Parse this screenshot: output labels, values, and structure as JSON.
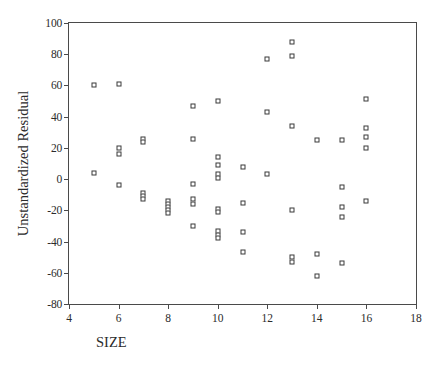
{
  "chart_data": {
    "type": "scatter",
    "title": "",
    "xlabel": "SIZE",
    "ylabel": "Unstandardized Residual",
    "xlim": [
      4,
      18
    ],
    "ylim": [
      -80,
      100
    ],
    "xticks": [
      4,
      6,
      8,
      10,
      12,
      14,
      16,
      18
    ],
    "yticks": [
      100,
      80,
      60,
      40,
      20,
      0,
      -20,
      -40,
      -60,
      -80
    ],
    "grid": false,
    "legend": null,
    "marker": "open-square",
    "marker_color": "#3a3a3a",
    "frame_color": "#4a4a4a",
    "points": [
      {
        "x": 5,
        "y": 60
      },
      {
        "x": 5,
        "y": 4
      },
      {
        "x": 6,
        "y": 61
      },
      {
        "x": 6,
        "y": 20
      },
      {
        "x": 6,
        "y": 16
      },
      {
        "x": 6,
        "y": -4
      },
      {
        "x": 7,
        "y": 26
      },
      {
        "x": 7,
        "y": 24
      },
      {
        "x": 7,
        "y": -9
      },
      {
        "x": 7,
        "y": -11
      },
      {
        "x": 7,
        "y": -13
      },
      {
        "x": 8,
        "y": -14
      },
      {
        "x": 8,
        "y": -16
      },
      {
        "x": 8,
        "y": -18
      },
      {
        "x": 8,
        "y": -20
      },
      {
        "x": 8,
        "y": -22
      },
      {
        "x": 9,
        "y": 47
      },
      {
        "x": 9,
        "y": 26
      },
      {
        "x": 9,
        "y": -3
      },
      {
        "x": 9,
        "y": -13
      },
      {
        "x": 9,
        "y": -16
      },
      {
        "x": 9,
        "y": -30
      },
      {
        "x": 10,
        "y": 50
      },
      {
        "x": 10,
        "y": 14
      },
      {
        "x": 10,
        "y": 9
      },
      {
        "x": 10,
        "y": 3
      },
      {
        "x": 10,
        "y": 1
      },
      {
        "x": 10,
        "y": -19
      },
      {
        "x": 10,
        "y": -21
      },
      {
        "x": 10,
        "y": -33
      },
      {
        "x": 10,
        "y": -36
      },
      {
        "x": 10,
        "y": -38
      },
      {
        "x": 11,
        "y": 8
      },
      {
        "x": 11,
        "y": -15
      },
      {
        "x": 11,
        "y": -34
      },
      {
        "x": 11,
        "y": -47
      },
      {
        "x": 12,
        "y": 77
      },
      {
        "x": 12,
        "y": 43
      },
      {
        "x": 12,
        "y": 3
      },
      {
        "x": 13,
        "y": 88
      },
      {
        "x": 13,
        "y": 79
      },
      {
        "x": 13,
        "y": 34
      },
      {
        "x": 13,
        "y": -20
      },
      {
        "x": 13,
        "y": -50
      },
      {
        "x": 13,
        "y": -53
      },
      {
        "x": 14,
        "y": 25
      },
      {
        "x": 14,
        "y": -48
      },
      {
        "x": 14,
        "y": -62
      },
      {
        "x": 15,
        "y": 25
      },
      {
        "x": 15,
        "y": -5
      },
      {
        "x": 15,
        "y": -18
      },
      {
        "x": 15,
        "y": -24
      },
      {
        "x": 15,
        "y": -54
      },
      {
        "x": 16,
        "y": 51
      },
      {
        "x": 16,
        "y": 33
      },
      {
        "x": 16,
        "y": 27
      },
      {
        "x": 16,
        "y": 20
      },
      {
        "x": 16,
        "y": -14
      }
    ]
  }
}
